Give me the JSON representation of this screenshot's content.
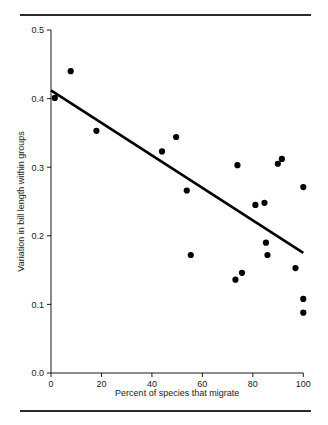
{
  "chart_data": {
    "type": "scatter",
    "title": "",
    "xlabel": "Percent of species that migrate",
    "ylabel": "Variation in bill length within groups",
    "xlim": [
      0,
      100
    ],
    "ylim": [
      0.0,
      0.5
    ],
    "xticks": [
      "0",
      "20",
      "40",
      "60",
      "80",
      "100"
    ],
    "xtick_values": [
      0,
      20,
      40,
      60,
      80,
      100
    ],
    "yticks": [
      "0.0",
      "0.1",
      "0.2",
      "0.3",
      "0.4",
      "0.5"
    ],
    "ytick_values": [
      0.0,
      0.1,
      0.2,
      0.3,
      0.4,
      0.5
    ],
    "grid": false,
    "legend": null,
    "series": [
      {
        "name": "species groups",
        "marker": "filled-circle",
        "color": "#000000",
        "points": [
          {
            "x": 1.5,
            "y": 0.401
          },
          {
            "x": 7.8,
            "y": 0.44
          },
          {
            "x": 18.0,
            "y": 0.353
          },
          {
            "x": 44.0,
            "y": 0.323
          },
          {
            "x": 49.6,
            "y": 0.344
          },
          {
            "x": 53.8,
            "y": 0.266
          },
          {
            "x": 55.4,
            "y": 0.172
          },
          {
            "x": 73.1,
            "y": 0.136
          },
          {
            "x": 73.9,
            "y": 0.303
          },
          {
            "x": 75.7,
            "y": 0.146
          },
          {
            "x": 81.0,
            "y": 0.245
          },
          {
            "x": 84.6,
            "y": 0.248
          },
          {
            "x": 85.2,
            "y": 0.19
          },
          {
            "x": 85.8,
            "y": 0.172
          },
          {
            "x": 89.9,
            "y": 0.305
          },
          {
            "x": 91.5,
            "y": 0.312
          },
          {
            "x": 96.9,
            "y": 0.153
          },
          {
            "x": 100.0,
            "y": 0.271
          },
          {
            "x": 100.0,
            "y": 0.108
          },
          {
            "x": 100.0,
            "y": 0.088
          }
        ]
      }
    ],
    "trendline": {
      "name": "least-squares fit",
      "color": "#000000",
      "x_start": 0,
      "y_start": 0.412,
      "x_end": 100,
      "y_end": 0.175
    }
  }
}
